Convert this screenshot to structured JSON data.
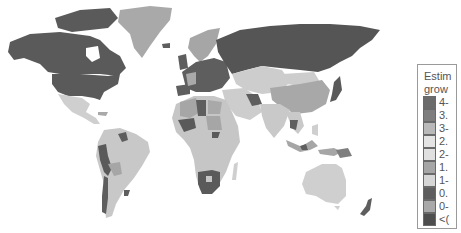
{
  "map": {
    "type": "choropleth",
    "subject": "world countries",
    "ocean_color": "#ffffff",
    "border_color": "#d8d8d8"
  },
  "legend": {
    "title_line1": "Estim",
    "title_line2": "grow",
    "items": [
      {
        "label": "4-",
        "color": "#6b6b6b"
      },
      {
        "label": "3.",
        "color": "#7e7e7e"
      },
      {
        "label": "3-",
        "color": "#b9b9b9"
      },
      {
        "label": "2.",
        "color": "#e4e4e4"
      },
      {
        "label": "2-",
        "color": "#e0e0e0"
      },
      {
        "label": "1.",
        "color": "#a6a6a6"
      },
      {
        "label": "1-",
        "color": "#d6d6d6"
      },
      {
        "label": "0.",
        "color": "#5e5e5e"
      },
      {
        "label": "0-",
        "color": "#a9a9a9"
      },
      {
        "label": "<(",
        "color": "#4e4e4e"
      }
    ]
  },
  "regions": [
    {
      "name": "North America (Canada/USA)",
      "shade": "#5a5a5a"
    },
    {
      "name": "Greenland",
      "shade": "#a9a9a9"
    },
    {
      "name": "Mexico/Central America",
      "shade": "#cfcfcf"
    },
    {
      "name": "South America",
      "shade": "#c8c8c8"
    },
    {
      "name": "Europe",
      "shade": "#5e5e5e"
    },
    {
      "name": "Russia",
      "shade": "#555555"
    },
    {
      "name": "Africa",
      "shade": "#c6c6c6"
    },
    {
      "name": "Southern Africa",
      "shade": "#5a5a5a"
    },
    {
      "name": "Middle East / Central Asia",
      "shade": "#cdcdcd"
    },
    {
      "name": "China",
      "shade": "#a8a8a8"
    },
    {
      "name": "India/SE Asia",
      "shade": "#c9c9c9"
    },
    {
      "name": "Australia",
      "shade": "#cfcfcf"
    },
    {
      "name": "New Zealand",
      "shade": "#5e5e5e"
    }
  ]
}
